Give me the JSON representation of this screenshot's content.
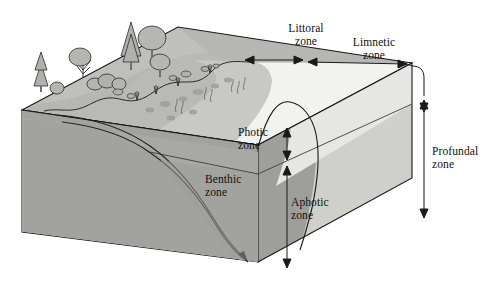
{
  "labels": {
    "littoral": {
      "line1": "Littoral",
      "line2": "zone"
    },
    "limnetic": {
      "line1": "Limnetic",
      "line2": "zone"
    },
    "profundal": {
      "line1": "Profundal",
      "line2": "zone"
    },
    "photic": {
      "line1": "Photic",
      "line2": "zone"
    },
    "aphotic": {
      "line1": "Aphotic",
      "line2": "zone"
    },
    "benthic": {
      "line1": "Benthic",
      "line2": "zone"
    }
  },
  "colors": {
    "outline": "#1a1a1a",
    "paper": "#ffffff",
    "land_top": "#b9b9b6",
    "land_top_shade": "#aeaeab",
    "shallow_bed": "#c0c0bd",
    "front_soil": "#a2a29f",
    "left_soil": "#adadaa",
    "water_surface": "#f2f2f0",
    "water_photic_front": "#c6c6c3",
    "water_right_upper": "#dedeDB",
    "water_right_lower": "#c3c3c0",
    "aphotic_water": "#b0b0ad",
    "deep_sediment": "#9a9a97",
    "tree_fill": "#b4b4b1",
    "tree_dark": "#8d8d8a",
    "plant_fill": "#aaaaa7"
  },
  "zones": [
    {
      "key": "littoral",
      "kind": "horizontal-span",
      "desc": "Shallow near-shore water measured across the top surface"
    },
    {
      "key": "limnetic",
      "kind": "horizontal-span",
      "desc": "Open sunlit surface water away from shore"
    },
    {
      "key": "photic",
      "kind": "vertical-span",
      "desc": "Upper illuminated water layer"
    },
    {
      "key": "aphotic",
      "kind": "vertical-span",
      "desc": "Lower dark water layer below light penetration"
    },
    {
      "key": "profundal",
      "kind": "vertical-span",
      "desc": "Deep water below the photic layer"
    },
    {
      "key": "benthic",
      "kind": "curve",
      "desc": "Lake bottom substrate following the sloping bed"
    }
  ]
}
